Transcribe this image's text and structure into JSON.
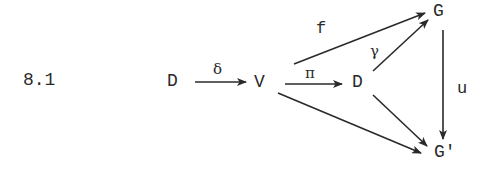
{
  "equation_number": "8.1",
  "nodes": {
    "D_left": "D",
    "V": "V",
    "D_mid": "D",
    "G": "G",
    "G_prime": "G'"
  },
  "arrows": [
    {
      "id": "delta",
      "from": "D_left",
      "to": "V",
      "label": "δ"
    },
    {
      "id": "pi",
      "from": "V",
      "to": "D_mid",
      "label": "π"
    },
    {
      "id": "f",
      "from": "V",
      "to": "G",
      "label": "f"
    },
    {
      "id": "gamma",
      "from": "D_mid",
      "to": "G",
      "label": "γ"
    },
    {
      "id": "u",
      "from": "G",
      "to": "G_prime",
      "label": "u"
    },
    {
      "id": "v_to_gprime",
      "from": "V",
      "to": "G_prime",
      "label": ""
    },
    {
      "id": "d_to_gprime",
      "from": "D_mid",
      "to": "G_prime",
      "label": ""
    }
  ],
  "labels": {
    "delta": "δ",
    "pi": "π",
    "f": "f",
    "gamma": "γ",
    "u": "u"
  },
  "colors": {
    "ink": "#2a2a2a",
    "background": "#ffffff"
  }
}
